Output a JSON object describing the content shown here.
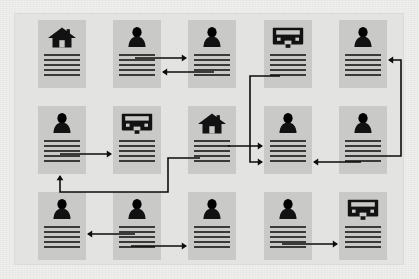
{
  "diagram": {
    "frame": {
      "x": 14,
      "y": 13,
      "w": 390,
      "h": 252,
      "color": "#e3e3e1"
    },
    "background_color": "#eeeeec",
    "card_color": "#c9c9c7",
    "ink_color": "#121212",
    "arrow_color": "#0d0d0d",
    "card_size": {
      "w": 48,
      "h": 68
    },
    "text_lines_per_card": 5,
    "icon_types": [
      "person-icon",
      "house-icon",
      "printer-icon"
    ],
    "rows": [
      {
        "row": 1,
        "cards": [
          {
            "id": "r1c1",
            "icon": "house-icon",
            "x": 38,
            "y": 20,
            "lines": 5
          },
          {
            "id": "r1c2",
            "icon": "person-icon",
            "x": 113,
            "y": 20,
            "lines": 5
          },
          {
            "id": "r1c3",
            "icon": "person-icon",
            "x": 188,
            "y": 20,
            "lines": 5
          },
          {
            "id": "r1c4",
            "icon": "printer-icon",
            "x": 264,
            "y": 20,
            "lines": 5
          },
          {
            "id": "r1c5",
            "icon": "person-icon",
            "x": 339,
            "y": 20,
            "lines": 5
          }
        ]
      },
      {
        "row": 2,
        "cards": [
          {
            "id": "r2c1",
            "icon": "person-icon",
            "x": 38,
            "y": 106,
            "lines": 5
          },
          {
            "id": "r2c2",
            "icon": "printer-icon",
            "x": 113,
            "y": 106,
            "lines": 5
          },
          {
            "id": "r2c3",
            "icon": "house-icon",
            "x": 188,
            "y": 106,
            "lines": 5
          },
          {
            "id": "r2c4",
            "icon": "person-icon",
            "x": 264,
            "y": 106,
            "lines": 5
          },
          {
            "id": "r2c5",
            "icon": "person-icon",
            "x": 339,
            "y": 106,
            "lines": 5
          }
        ]
      },
      {
        "row": 3,
        "cards": [
          {
            "id": "r3c1",
            "icon": "person-icon",
            "x": 38,
            "y": 192,
            "lines": 5
          },
          {
            "id": "r3c2",
            "icon": "person-icon",
            "x": 113,
            "y": 192,
            "lines": 5
          },
          {
            "id": "r3c3",
            "icon": "person-icon",
            "x": 188,
            "y": 192,
            "lines": 5
          },
          {
            "id": "r3c4",
            "icon": "person-icon",
            "x": 264,
            "y": 192,
            "lines": 5
          },
          {
            "id": "r3c5",
            "icon": "printer-icon",
            "x": 339,
            "y": 192,
            "lines": 5
          }
        ]
      }
    ],
    "connections": [
      {
        "id": "a1",
        "from": "r1c2",
        "to": "r1c3",
        "direction": "right",
        "kind": "straight"
      },
      {
        "id": "a2",
        "from": "r1c3",
        "to": "r1c2",
        "direction": "left",
        "kind": "straight"
      },
      {
        "id": "a3",
        "from": "r1c4",
        "to": "r2c4",
        "direction": "down-left-routed",
        "kind": "elbow"
      },
      {
        "id": "a4",
        "from": "r1c5",
        "to": "r2c5",
        "direction": "up-routed",
        "kind": "elbow"
      },
      {
        "id": "a5",
        "from": "r2c1",
        "to": "r2c2",
        "direction": "right",
        "kind": "straight"
      },
      {
        "id": "a6",
        "from": "r2c3",
        "to": "r2c1",
        "direction": "down-left-routed",
        "kind": "elbow"
      },
      {
        "id": "a7",
        "from": "r2c3",
        "to": "r2c4",
        "direction": "right",
        "kind": "straight"
      },
      {
        "id": "a8",
        "from": "r2c5",
        "to": "r2c4",
        "direction": "left",
        "kind": "straight"
      },
      {
        "id": "a9",
        "from": "r3c2",
        "to": "r3c1",
        "direction": "left",
        "kind": "straight"
      },
      {
        "id": "a10",
        "from": "r3c2",
        "to": "r3c3",
        "direction": "right",
        "kind": "straight"
      },
      {
        "id": "a11",
        "from": "r3c4",
        "to": "r3c5",
        "direction": "right",
        "kind": "straight"
      }
    ]
  }
}
